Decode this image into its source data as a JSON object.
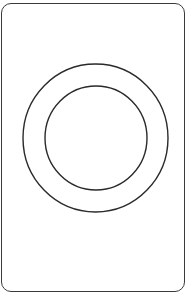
{
  "diagram": {
    "shape": "card-with-concentric-rings",
    "card": {
      "stroke": "#3a3a3a",
      "fill": "#ffffff",
      "corner_radius": 10
    },
    "rings": [
      {
        "name": "outer",
        "cx": 95.5,
        "cy": 138,
        "rx": 72.5,
        "ry": 74,
        "stroke": "#2a2a2a"
      },
      {
        "name": "inner",
        "cx": 96,
        "cy": 138,
        "rx": 51,
        "ry": 52,
        "stroke": "#2a2a2a"
      }
    ]
  }
}
